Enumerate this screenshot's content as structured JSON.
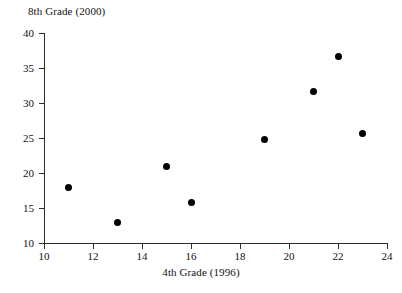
{
  "chart_data": {
    "type": "scatter",
    "title": "8th Grade (2000)",
    "xlabel": "4th Grade (1996)",
    "ylabel": "8th Grade (2000)",
    "xlim": [
      10,
      24
    ],
    "ylim": [
      10,
      40
    ],
    "xticks": [
      10,
      12,
      14,
      16,
      18,
      20,
      22,
      24
    ],
    "yticks": [
      10,
      15,
      20,
      25,
      30,
      35,
      40
    ],
    "grid": false,
    "legend": false,
    "marker": "filled-circle",
    "marker_color": "#000000",
    "x": [
      11,
      13,
      15,
      16,
      19,
      21,
      22,
      23
    ],
    "y": [
      17.9,
      12.9,
      20.9,
      15.8,
      24.8,
      31.7,
      36.7,
      25.6
    ],
    "points": [
      {
        "x": 11,
        "y": 17.9
      },
      {
        "x": 13,
        "y": 12.9
      },
      {
        "x": 15,
        "y": 20.9
      },
      {
        "x": 16,
        "y": 15.8
      },
      {
        "x": 19,
        "y": 24.8
      },
      {
        "x": 21,
        "y": 31.7
      },
      {
        "x": 22,
        "y": 36.7
      },
      {
        "x": 23,
        "y": 25.6
      }
    ]
  },
  "figure": {
    "background": "#ffffff",
    "axis_color": "#2b2b2b",
    "text_color": "#111111"
  }
}
